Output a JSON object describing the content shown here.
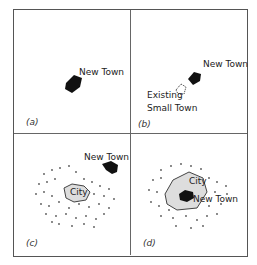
{
  "figure": {
    "panels": [
      {
        "id": "a",
        "tag": "(a)",
        "labels": [
          "New Town"
        ]
      },
      {
        "id": "b",
        "tag": "(b)",
        "labels": [
          "New Town",
          "Existing",
          "Small Town"
        ]
      },
      {
        "id": "c",
        "tag": "(c)",
        "labels": [
          "New Town",
          "City"
        ]
      },
      {
        "id": "d",
        "tag": "(d)",
        "labels": [
          "City",
          "New Town"
        ]
      }
    ]
  }
}
